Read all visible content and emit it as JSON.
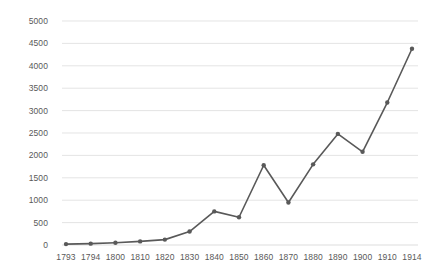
{
  "chart_data": {
    "type": "line",
    "title": "",
    "subtitle": "",
    "xlabel": "",
    "ylabel": "",
    "categories": [
      "1793",
      "1794",
      "1800",
      "1810",
      "1820",
      "1830",
      "1840",
      "1850",
      "1860",
      "1870",
      "1880",
      "1890",
      "1900",
      "1910",
      "1914"
    ],
    "values": [
      20,
      30,
      50,
      80,
      120,
      300,
      750,
      620,
      1780,
      950,
      1800,
      2480,
      2080,
      3180,
      4380
    ],
    "series": [
      {
        "name": "",
        "values": [
          20,
          30,
          50,
          80,
          120,
          300,
          750,
          620,
          1780,
          950,
          1800,
          2480,
          2080,
          3180,
          4380
        ]
      }
    ],
    "ylim": [
      0,
      5000
    ],
    "ytick_labels": [
      "0",
      "500",
      "1000",
      "1500",
      "2000",
      "2500",
      "3000",
      "3500",
      "4000",
      "4500",
      "5000"
    ],
    "ytick_values": [
      0,
      500,
      1000,
      1500,
      2000,
      2500,
      3000,
      3500,
      4000,
      4500,
      5000
    ],
    "grid": true,
    "grid_axis": "y",
    "legend": false,
    "legend_position": "none",
    "markers": true,
    "line_color": "#595959",
    "marker_color": "#595959",
    "grid_color": "#d9d9d9",
    "text_color": "#595959",
    "background_color": "#ffffff"
  }
}
